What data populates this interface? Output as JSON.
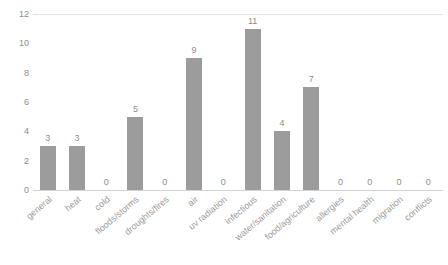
{
  "chart_data": {
    "type": "bar",
    "title": "",
    "subtitle": "",
    "xlabel": "",
    "ylabel": "",
    "categories": [
      "general",
      "heat",
      "cold",
      "floods/storms",
      "droughts/fires",
      "air",
      "uv radiation",
      "infectious",
      "water/sanitation",
      "food/agriculture",
      "allergies",
      "mental health",
      "migration",
      "conflicts"
    ],
    "values": [
      3,
      3,
      0,
      5,
      0,
      9,
      0,
      11,
      4,
      7,
      0,
      0,
      0,
      0
    ],
    "data_labels": [
      "3",
      "3",
      "0",
      "5",
      "0",
      "9",
      "0",
      "11",
      "4",
      "7",
      "0",
      "0",
      "0",
      "0"
    ],
    "ylim": [
      0,
      12
    ],
    "yticks": [
      0,
      2,
      4,
      6,
      8,
      10,
      12
    ],
    "ytick_labels": [
      "0",
      "2",
      "4",
      "6",
      "8",
      "10",
      "12"
    ],
    "grid": false,
    "legend": false,
    "legend_position": "none",
    "bar_color": "#9c9c9c",
    "label_color": "#8d8d8d",
    "axis_color": "#d2d2d2",
    "background": "#ffffff",
    "xtick_rotation": -40
  }
}
